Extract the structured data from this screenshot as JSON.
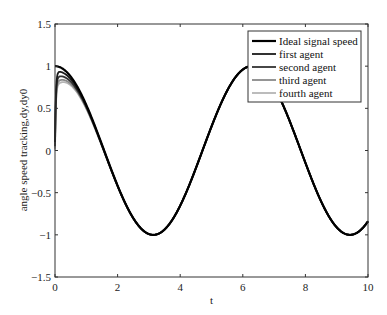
{
  "chart_data": {
    "type": "line",
    "title": "",
    "xlabel": "t",
    "ylabel": "angle speed tracking,dy,dy0",
    "xlim": [
      0,
      10
    ],
    "ylim": [
      -1.5,
      1.5
    ],
    "xticks": [
      0,
      2,
      4,
      6,
      8,
      10
    ],
    "xtick_labels": [
      "0",
      "2",
      "4",
      "6",
      "8",
      "10"
    ],
    "yticks": [
      -1.5,
      -1,
      -0.5,
      0,
      0.5,
      1,
      1.5
    ],
    "ytick_labels": [
      "-1.5",
      "-1",
      "-0.5",
      "0",
      "0.5",
      "1",
      "1.5"
    ],
    "grid": false,
    "legend_position": "upper right",
    "series": [
      {
        "name": "Ideal signal speed",
        "color": "#000000",
        "width": 2.2,
        "function": "cos(t)",
        "y0": 1.0,
        "peak": 1.0
      },
      {
        "name": "first agent",
        "color": "#1a1a1a",
        "width": 1.8,
        "function": "transient to cos(t)",
        "y0": 0.1,
        "peak": 0.93
      },
      {
        "name": "second agent",
        "color": "#333333",
        "width": 1.8,
        "function": "transient to cos(t)",
        "y0": 0.05,
        "peak": 0.86
      },
      {
        "name": "third agent",
        "color": "#8a8a8a",
        "width": 1.8,
        "function": "transient to cos(t)",
        "y0": 0.02,
        "peak": 0.8
      },
      {
        "name": "fourth agent",
        "color": "#b5b5b5",
        "width": 1.8,
        "function": "transient to cos(t)",
        "y0": 0.0,
        "peak": 0.76
      }
    ],
    "key_points": {
      "ideal_max_t0": [
        0,
        1
      ],
      "min_at": [
        3.14,
        -1
      ],
      "max_at": [
        6.28,
        1
      ],
      "min2_at": [
        9.42,
        -1
      ]
    }
  }
}
